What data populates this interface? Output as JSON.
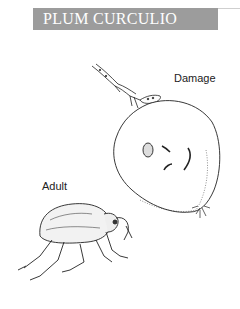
{
  "header": {
    "title": "PLUM CURCULIO",
    "background_color": "#9c9c9c",
    "text_color": "#ffffff"
  },
  "labels": {
    "damage": "Damage",
    "adult": "Adult"
  },
  "illustrations": [
    {
      "name": "weevil-on-twig",
      "description": "Adult weevil crawling on a branch toward the fruit"
    },
    {
      "name": "damaged-plum",
      "description": "Plum fruit with crescent-shaped oviposition scars"
    },
    {
      "name": "adult-weevil",
      "description": "Side view of adult plum curculio beetle with snout"
    }
  ]
}
